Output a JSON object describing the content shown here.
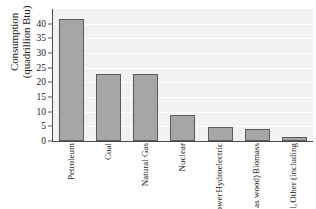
{
  "chart_data": {
    "type": "bar",
    "title": "",
    "xlabel": "",
    "ylabel": "Consumption (quadrillion Btu)",
    "ylabel_lines": [
      "Consumption",
      "(quadrillion Btu)"
    ],
    "categories": [
      "Petroleum",
      "Coal",
      "Natural Gas",
      "Nuclear",
      "Hydroelectric Power",
      "Biomass (such as wood)",
      "Other (including geothermal, wind, and solar)"
    ],
    "category_lines": [
      [
        "Petroleum"
      ],
      [
        "Coal"
      ],
      [
        "Natural Gas"
      ],
      [
        "Nuclear"
      ],
      [
        "Hydroelectric",
        "Power"
      ],
      [
        "Biomass",
        "(such as wood)"
      ],
      [
        "Other (including",
        "geothermal,",
        "wind, and solar)"
      ]
    ],
    "values": [
      41.5,
      22.8,
      22.8,
      8.8,
      4.7,
      4.1,
      1.2
    ],
    "ylim": [
      0,
      45
    ],
    "yticks": [
      0,
      5,
      10,
      15,
      20,
      25,
      30,
      35,
      40
    ],
    "ytick_labels": [
      "0",
      "5",
      "10",
      "15",
      "20",
      "25",
      "30",
      "35",
      "40"
    ],
    "grid": true,
    "legend": false,
    "bar_color": "#a6a6a6",
    "bar_border_color": "#5a5a5a",
    "plot_background": "#f2f2f2",
    "gridline_color": "#ffffff",
    "axis_color": "#4a4a4a"
  }
}
